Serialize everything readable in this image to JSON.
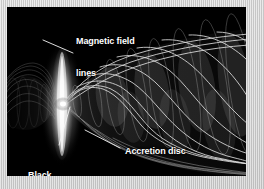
{
  "figure": {
    "background_color": "#000000",
    "border_color": "#cfcfcf",
    "label_color": "#ffffff",
    "leader_color": "#f2f2f2",
    "labels": {
      "magnetic_field_lines": "Magnetic field\nlines",
      "magnetic_field_lines_line1": "Magnetic field",
      "magnetic_field_lines_line2": "lines",
      "black_hole": "Black\nhole",
      "black_hole_line1": "Black",
      "black_hole_line2": "hole",
      "accretion_disc": "Accretion disc"
    },
    "elements": {
      "accretion_disc_name": "accretion-disc",
      "black_hole_name": "black-hole",
      "jet_name": "relativistic-jet",
      "counter_jet_name": "counter-jet",
      "helix_name": "helical-magnetic-field-lines"
    }
  }
}
